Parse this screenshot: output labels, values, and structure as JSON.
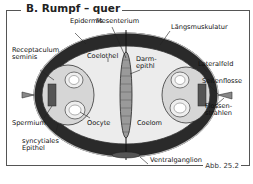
{
  "figure": {
    "title": "B. Rumpf – quer",
    "caption": "Abb. 25.2"
  },
  "labels": {
    "epidermis": "Epidermis",
    "mesenterium": "Mesenterium",
    "laengsmuskulatur": "Längsmuskulatur",
    "receptaculum": "Receptaculum\nseminis",
    "coelothel": "Coelothel",
    "darmepithel": "Darm-\nepithl",
    "lateralfeld": "Lateralfeld",
    "seitenflosse": "Seitenflosse",
    "spermium": "Spermium",
    "oocyte": "Oocyte",
    "coelom": "Coelom",
    "flossenstrahlen": "Flossen-\nstrahlen",
    "syncytiales_epithel": "syncytiales\nEpithel",
    "ventralganglion": "Ventralganglion"
  },
  "colors": {
    "muscle": "#2a2a2a",
    "coelom": "#ececec",
    "organ": "#d6d6d6",
    "line": "#222222"
  }
}
